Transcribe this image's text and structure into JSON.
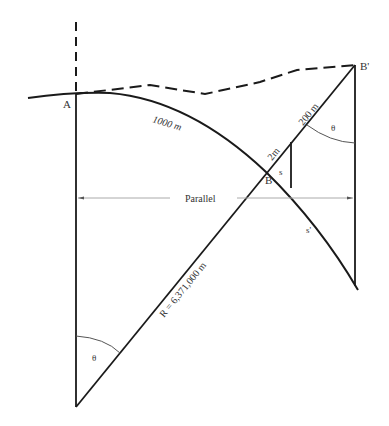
{
  "diagram": {
    "labels": {
      "point_a": "A",
      "point_b": "B",
      "point_b_prime": "B'",
      "arc_length": "1000 m",
      "height_offset": "200 m",
      "small_offset": "2m",
      "arc_s": "s",
      "arc_s_prime": "s'",
      "parallel": "Parallel",
      "radius": "R = 6,371,000 m",
      "angle_bottom": "θ",
      "angle_top": "θ"
    },
    "colors": {
      "line": "#1a1a1a",
      "parallel_line": "#aaaaaa",
      "angle_arc": "#555555",
      "text": "#333333"
    }
  }
}
